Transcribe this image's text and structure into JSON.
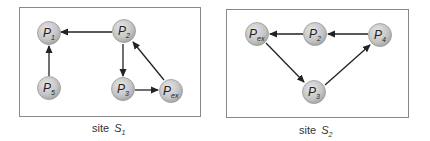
{
  "colors": {
    "node_fill": "#c8c8c8",
    "node_stroke": "#9a9a9a",
    "edge": "#222222",
    "box": "#888888"
  },
  "sites": [
    {
      "caption_prefix": "site ",
      "caption_letter": "S",
      "caption_sub": "1",
      "nodes": [
        {
          "id": "P1",
          "base": "P",
          "sub": "1"
        },
        {
          "id": "P2",
          "base": "P",
          "sub": "2"
        },
        {
          "id": "P5",
          "base": "P",
          "sub": "5"
        },
        {
          "id": "P3",
          "base": "P",
          "sub": "3"
        },
        {
          "id": "Pex",
          "base": "P",
          "sub": "ex"
        }
      ],
      "edges": [
        {
          "from": "P2",
          "to": "P1"
        },
        {
          "from": "P5",
          "to": "P1"
        },
        {
          "from": "P2",
          "to": "P3"
        },
        {
          "from": "P3",
          "to": "Pex"
        },
        {
          "from": "Pex",
          "to": "P2"
        }
      ]
    },
    {
      "caption_prefix": "site ",
      "caption_letter": "S",
      "caption_sub": "2",
      "nodes": [
        {
          "id": "Pex",
          "base": "P",
          "sub": "ex"
        },
        {
          "id": "P2",
          "base": "P",
          "sub": "2"
        },
        {
          "id": "P4",
          "base": "P",
          "sub": "4"
        },
        {
          "id": "P3",
          "base": "P",
          "sub": "3"
        }
      ],
      "edges": [
        {
          "from": "P2",
          "to": "Pex"
        },
        {
          "from": "P4",
          "to": "P2"
        },
        {
          "from": "Pex",
          "to": "P3"
        },
        {
          "from": "P3",
          "to": "P4"
        }
      ]
    }
  ]
}
